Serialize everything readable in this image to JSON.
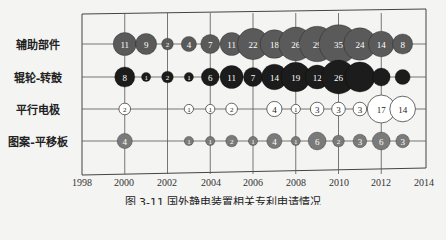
{
  "chart_data": {
    "type": "bubble",
    "title": "",
    "caption": "图 3-11  国外静电装置相关专利申请情况",
    "xlabel": "",
    "ylabel": "",
    "xlim": [
      1998,
      2014
    ],
    "x_ticks": [
      1998,
      2000,
      2002,
      2004,
      2006,
      2008,
      2010,
      2012,
      2014
    ],
    "grid": true,
    "categories": [
      "辅助部件",
      "辊轮-转鼓",
      "平行电极",
      "图案-平移板"
    ],
    "series": [
      {
        "name": "辅助部件",
        "color": "#5a5a5a",
        "text_color": "#ffffff",
        "points": [
          {
            "year": 2000,
            "value": 11
          },
          {
            "year": 2001,
            "value": 9
          },
          {
            "year": 2002,
            "value": 2
          },
          {
            "year": 2003,
            "value": 4
          },
          {
            "year": 2004,
            "value": 7
          },
          {
            "year": 2005,
            "value": 11
          },
          {
            "year": 2006,
            "value": 22
          },
          {
            "year": 2007,
            "value": 18
          },
          {
            "year": 2008,
            "value": 26
          },
          {
            "year": 2009,
            "value": 29
          },
          {
            "year": 2010,
            "value": 35
          },
          {
            "year": 2011,
            "value": 24
          },
          {
            "year": 2012,
            "value": 14
          },
          {
            "year": 2013,
            "value": 8
          }
        ]
      },
      {
        "name": "辊轮-转鼓",
        "color": "#1c1c1c",
        "text_color": "#ffffff",
        "points": [
          {
            "year": 2000,
            "value": 8
          },
          {
            "year": 2001,
            "value": 1
          },
          {
            "year": 2002,
            "value": 2
          },
          {
            "year": 2003,
            "value": 1
          },
          {
            "year": 2004,
            "value": 6
          },
          {
            "year": 2005,
            "value": 11
          },
          {
            "year": 2006,
            "value": 7
          },
          {
            "year": 2007,
            "value": 14
          },
          {
            "year": 2008,
            "value": 19
          },
          {
            "year": 2009,
            "value": 12
          },
          {
            "year": 2010,
            "value": 26
          },
          {
            "year": 2011,
            "value": 20,
            "label": ""
          },
          {
            "year": 2012,
            "value": 6,
            "label": ""
          },
          {
            "year": 2013,
            "value": 4,
            "label": ""
          }
        ]
      },
      {
        "name": "平行电极",
        "color": "#ffffff",
        "text_color": "#222222",
        "points": [
          {
            "year": 2000,
            "value": 2
          },
          {
            "year": 2003,
            "value": 1
          },
          {
            "year": 2004,
            "value": 1
          },
          {
            "year": 2005,
            "value": 2
          },
          {
            "year": 2007,
            "value": 4
          },
          {
            "year": 2008,
            "value": 1
          },
          {
            "year": 2009,
            "value": 3
          },
          {
            "year": 2010,
            "value": 3
          },
          {
            "year": 2011,
            "value": 3
          },
          {
            "year": 2012,
            "value": 17
          },
          {
            "year": 2013,
            "value": 14
          }
        ]
      },
      {
        "name": "图案-平移板",
        "color": "#7a7a7a",
        "text_color": "#222222",
        "points": [
          {
            "year": 2000,
            "value": 4
          },
          {
            "year": 2003,
            "value": 1
          },
          {
            "year": 2004,
            "value": 1
          },
          {
            "year": 2005,
            "value": 2
          },
          {
            "year": 2006,
            "value": 1
          },
          {
            "year": 2007,
            "value": 4
          },
          {
            "year": 2008,
            "value": 1
          },
          {
            "year": 2009,
            "value": 6
          },
          {
            "year": 2010,
            "value": 2
          },
          {
            "year": 2011,
            "value": 3
          },
          {
            "year": 2012,
            "value": 6
          },
          {
            "year": 2013,
            "value": 3
          }
        ]
      }
    ]
  },
  "labels": {
    "rows": [
      "辅助部件",
      "辊轮-转鼓",
      "平行电极",
      "图案-平移板"
    ],
    "ticks": [
      "1998",
      "2000",
      "2002",
      "2004",
      "2006",
      "2008",
      "2010",
      "2012",
      "2014"
    ],
    "caption": "图 3-11  国外静电装置相关专利申请情况"
  }
}
